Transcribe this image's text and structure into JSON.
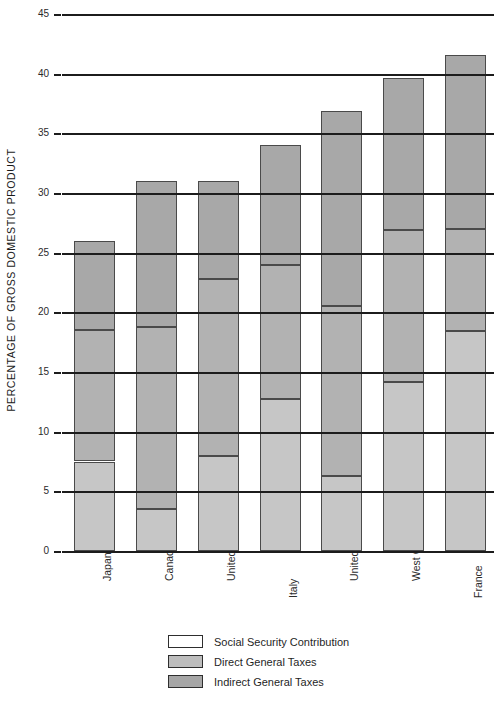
{
  "chart_data": {
    "type": "bar",
    "title": "",
    "subtitle": "",
    "xlabel": "",
    "ylabel": "PERCENTAGE OF GROSS DOMESTIC PRODUCT",
    "stacked": true,
    "orientation": "vertical",
    "grid": true,
    "gridlines": "horizontal",
    "legend_position": "bottom-center",
    "ylim": [
      0,
      45
    ],
    "yticks": [
      0,
      5,
      10,
      15,
      20,
      25,
      30,
      35,
      40,
      45
    ],
    "ytick_labels": [
      "0",
      "5",
      "10",
      "15",
      "20",
      "25",
      "30",
      "35",
      "40",
      "45"
    ],
    "categories": [
      "Japan",
      "Canada",
      "United States",
      "Italy",
      "United Kingdom",
      "West Germany",
      "France"
    ],
    "series": [
      {
        "name": "Social Security Contribution",
        "color": "#c6c6c6",
        "legend_swatch_color": "#ffffff",
        "values": [
          7.5,
          3.5,
          8.0,
          12.7,
          6.3,
          14.2,
          18.4
        ]
      },
      {
        "name": "Direct General Taxes",
        "color": "#b2b2b2",
        "legend_swatch_color": "#bdbdbd",
        "values": [
          11.0,
          15.3,
          14.8,
          11.3,
          14.2,
          12.7,
          8.6
        ]
      },
      {
        "name": "Indirect General Taxes",
        "color": "#a8a8a8",
        "legend_swatch_color": "#a6a6a6",
        "values": [
          7.5,
          12.2,
          8.2,
          10.0,
          16.4,
          12.7,
          14.6
        ]
      }
    ],
    "cumulative_boundaries": [
      {
        "category": "Japan",
        "social": 7.5,
        "social_plus_direct": 18.5,
        "total": 26.0
      },
      {
        "category": "Canada",
        "social": 3.5,
        "social_plus_direct": 18.8,
        "total": 31.0
      },
      {
        "category": "United States",
        "social": 8.0,
        "social_plus_direct": 22.8,
        "total": 31.0
      },
      {
        "category": "Italy",
        "social": 12.7,
        "social_plus_direct": 24.0,
        "total": 34.0
      },
      {
        "category": "United Kingdom",
        "social": 6.3,
        "social_plus_direct": 20.5,
        "total": 36.9
      },
      {
        "category": "West Germany",
        "social": 14.2,
        "social_plus_direct": 26.9,
        "total": 39.6
      },
      {
        "category": "France",
        "social": 18.4,
        "social_plus_direct": 27.0,
        "total": 41.6
      }
    ],
    "totals": [
      26.0,
      31.0,
      31.0,
      34.0,
      36.9,
      39.6,
      41.6
    ]
  },
  "legend": {
    "items": [
      {
        "label": "Social Security Contribution",
        "swatch": "#ffffff"
      },
      {
        "label": "Direct General Taxes",
        "swatch": "#bdbdbd"
      },
      {
        "label": "Indirect General Taxes",
        "swatch": "#a6a6a6"
      }
    ]
  },
  "axis": {
    "y_title": "PERCENTAGE OF GROSS DOMESTIC PRODUCT"
  }
}
